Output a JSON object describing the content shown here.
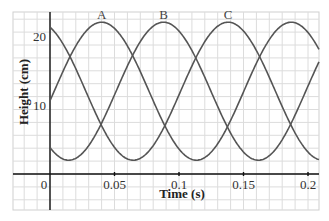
{
  "chart_data": {
    "type": "line",
    "title": "",
    "xlabel": "Time (s)",
    "ylabel": "Height (cm)",
    "xlim": [
      -0.028,
      0.21
    ],
    "ylim": [
      -5,
      23
    ],
    "grid": true,
    "x_ticks": [
      {
        "value": 0,
        "label": "0"
      },
      {
        "value": 0.05,
        "label": "0.05"
      },
      {
        "value": 0.1,
        "label": "0.1"
      },
      {
        "value": 0.15,
        "label": "0.15"
      },
      {
        "value": 0.2,
        "label": "0.2"
      }
    ],
    "y_ticks": [
      {
        "value": 10,
        "label": "10"
      },
      {
        "value": 20,
        "label": "20"
      }
    ],
    "series": [
      {
        "name": "A",
        "label": "A",
        "model": "12 + 10*cos(2*pi*(t - t_peak)/T)",
        "mean_cm": 12,
        "amplitude_cm": 10,
        "period_s": 0.147,
        "peak_times_s": [
          0.04,
          0.188
        ],
        "min_times_s": [
          0.114
        ],
        "start_value_cm": 11
      },
      {
        "name": "B",
        "label": "B",
        "model": "12 + 10*cos(2*pi*(t - t_peak)/T)",
        "mean_cm": 12,
        "amplitude_cm": 10,
        "period_s": 0.147,
        "peak_times_s": [
          0.088
        ],
        "min_times_s": [
          0.014,
          0.162
        ],
        "start_value_cm": 4
      },
      {
        "name": "C",
        "label": "C",
        "model": "12 + 10*cos(2*pi*(t - t_peak)/T)",
        "mean_cm": 12,
        "amplitude_cm": 10,
        "period_s": 0.147,
        "peak_times_s": [
          -0.009,
          0.138
        ],
        "min_times_s": [
          0.063,
          0.21
        ],
        "start_value_cm": 21
      }
    ],
    "annotations": [
      "A",
      "B",
      "C"
    ]
  }
}
